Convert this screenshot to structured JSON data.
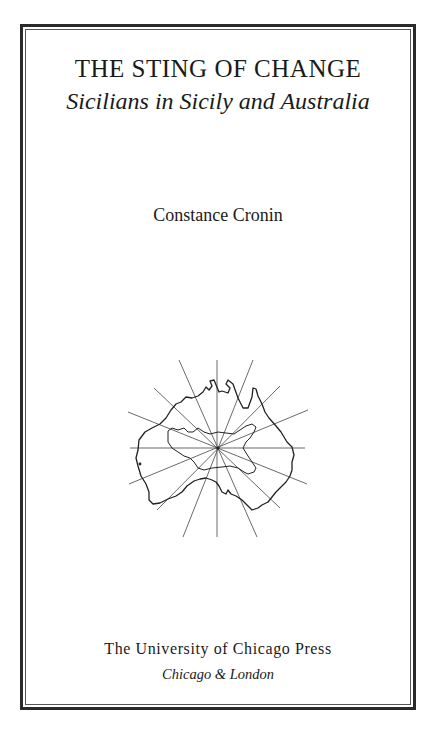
{
  "title_page": {
    "title": "THE STING OF CHANGE",
    "subtitle": "Sicilians in Sicily and Australia",
    "author": "Constance Cronin",
    "publisher": "The University of Chicago Press",
    "place": "Chicago & London"
  },
  "illustration": {
    "description": "Outline map of Australia with radiating compass lines from a central point",
    "icon": "australia-map-compass-rays",
    "line_color": "#333333"
  },
  "colors": {
    "background": "#ffffff",
    "text": "#1a1a1a",
    "border": "#2a2a2a"
  }
}
